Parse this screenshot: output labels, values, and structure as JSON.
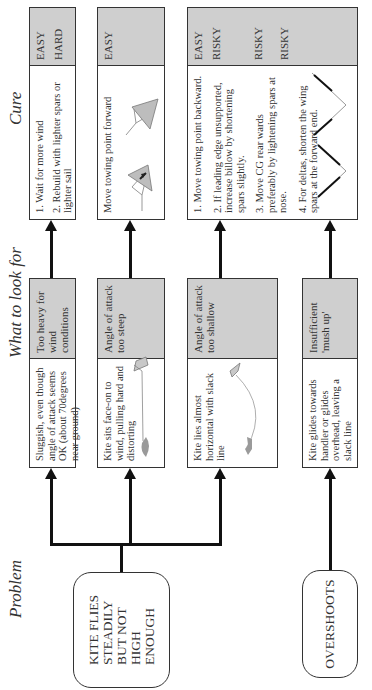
{
  "headers": {
    "problem": "Problem",
    "look": "What to look for",
    "cure": "Cure"
  },
  "problems": [
    {
      "label": "KITE FLIES STEADILY BUT NOT HIGH ENOUGH",
      "lines": [
        "KITE FLIES",
        "STEADILY",
        "BUT NOT",
        "HIGH",
        "ENOUGH"
      ]
    },
    {
      "label": "OVERSHOOTS",
      "lines": [
        "OVERSHOOTS"
      ]
    }
  ],
  "symptoms": [
    {
      "description": "Sluggish, even though angle of attack seems OK (about 70degrees near ground)",
      "cause": "Too heavy for wind conditions"
    },
    {
      "description": "Kite sits face-on to wind, pulling hard and distorting",
      "cause": "Angle of attack too steep"
    },
    {
      "description": "Kite lies almost horizontal with slack line",
      "cause": "Angle of attack too shallow"
    },
    {
      "description": "Kite glides towards handler or glides overhead, leaving a slack line",
      "cause": "Insufficient 'mush up'"
    }
  ],
  "cures": [
    {
      "items": [
        "1. Wait for more wind",
        "2. Rebuild with lighter spars or lighter sail"
      ],
      "ratings": [
        "EASY",
        "HARD"
      ]
    },
    {
      "items": [
        "Move towing point forward"
      ],
      "ratings": [
        "EASY"
      ]
    },
    {
      "items": [
        "1. Move towing point backward.",
        "2. If leading edge unsupported, increase billow by shortening spars slightly.",
        "3. Move CG rear wards preferably by lightening spars at nose.",
        "4. For deltas, shorten the wing spars at the forward end."
      ],
      "ratings": [
        "EASY",
        "RISKY",
        "RISKY",
        "RISKY"
      ]
    }
  ],
  "colors": {
    "rating_bg": "#cfcfcf",
    "line": "#111111",
    "figure": "#9a9a9a"
  }
}
